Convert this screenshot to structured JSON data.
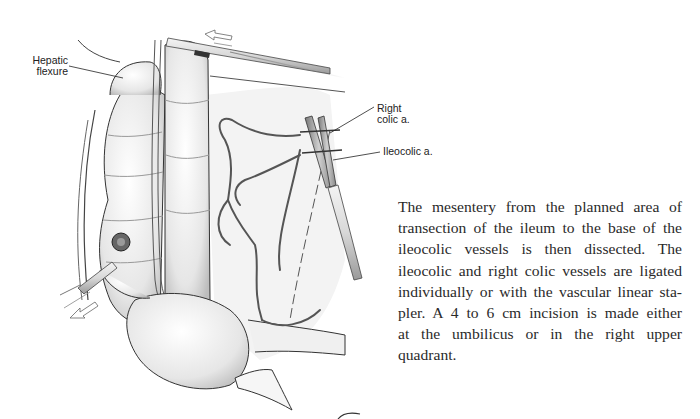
{
  "figure": {
    "labels": {
      "hepatic_flexure": [
        "Hepatic",
        "flexure"
      ],
      "right_colic": [
        "Right",
        "colic a."
      ],
      "ileocolic": "Ileocolic a."
    }
  },
  "body_text": {
    "lines": [
      "The mesentery from the planned area of",
      "transection of the ileum to the base of the",
      "ileocolic vessels is then dissected. The",
      "ileocolic and right colic vessels are ligated",
      "individually or with the vascular linear sta-",
      "pler. A 4 to 6 cm incision is made either",
      "at the umbilicus or in the right upper",
      "quadrant."
    ]
  }
}
